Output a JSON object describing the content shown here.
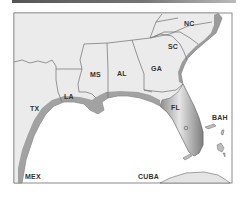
{
  "map": {
    "title": "Southeastern United States and Gulf of Mexico",
    "labels": {
      "nc": "NC",
      "sc": "SC",
      "ga": "GA",
      "al": "AL",
      "ms": "MS",
      "la": "LA",
      "tx": "TX",
      "fl": "FL",
      "bah": "BAH",
      "mex": "MEX",
      "cuba": "CUBA"
    },
    "colors": {
      "land": "#ebebeb",
      "border": "#6e6e6e",
      "frame": "#8a8a8a",
      "coast_shade": "#7a7a7a",
      "water": "#ffffff"
    }
  }
}
